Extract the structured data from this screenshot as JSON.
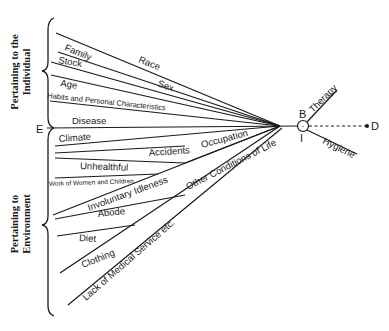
{
  "diagram": {
    "groups": {
      "individual": {
        "line1": "Pertaining to the",
        "line2": "Individual"
      },
      "environment": {
        "line1": "Pertaining to",
        "line2": "Environment"
      }
    },
    "points": {
      "E": "E",
      "B": "B",
      "I": "I",
      "D": "D"
    },
    "factors_individual": {
      "family": "Family",
      "race": "Race",
      "stock": "Stock",
      "sex": "Sex",
      "age": "Age",
      "habits": "Habits and Personal Characteristics",
      "disease": "Disease"
    },
    "factors_environment": {
      "climate": "Climate",
      "accidents": "Accidents",
      "occupation": "Occupation",
      "unhealthful": "Unhealthful",
      "work": "Work of Women and Children",
      "idleness": "Involuntary Idleness",
      "other": "Other Conditions of Life",
      "abode": "Abode",
      "diet": "Diet",
      "clothing": "Clothing",
      "medical": "Lack of Medical Service etc."
    },
    "outcomes": {
      "therapy": "Therapy",
      "hygiene": "Hygiene",
      "circle_mark": "-"
    },
    "colors": {
      "ink": "#1a1a1a",
      "background": "#ffffff"
    }
  }
}
